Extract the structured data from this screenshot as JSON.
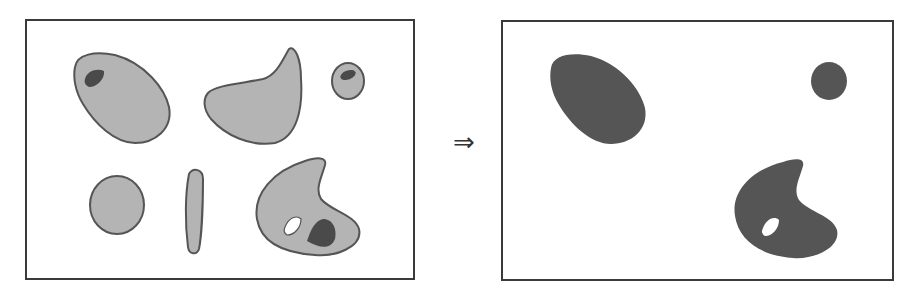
{
  "diagram": {
    "arrow_symbol": "⇒",
    "colors": {
      "frame": "#3a3a3a",
      "light_fill": "#b4b4b4",
      "outline": "#555555",
      "dark_fill": "#555555",
      "hole": "#ffffff"
    },
    "before_panel": {
      "objects": [
        {
          "shape": "egg-blob",
          "fill": "light",
          "inner": "dark-spot"
        },
        {
          "shape": "horn-blob",
          "fill": "light",
          "inner": "none"
        },
        {
          "shape": "small-oval",
          "fill": "light",
          "inner": "dark-spot"
        },
        {
          "shape": "circle",
          "fill": "light",
          "inner": "none"
        },
        {
          "shape": "thin-rod",
          "fill": "light",
          "inner": "none"
        },
        {
          "shape": "hook-blob",
          "fill": "light",
          "inner": "white-hole-and-dark-spot"
        }
      ]
    },
    "after_panel": {
      "objects": [
        {
          "shape": "egg-blob",
          "fill": "dark"
        },
        {
          "shape": "small-oval",
          "fill": "dark"
        },
        {
          "shape": "hook-blob",
          "fill": "dark",
          "inner": "white-hole"
        }
      ]
    }
  }
}
